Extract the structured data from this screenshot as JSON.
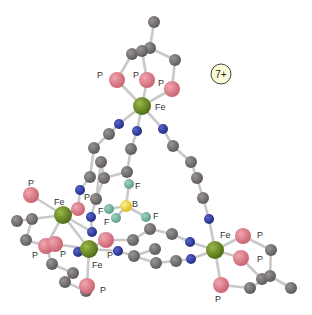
{
  "diagram": {
    "title": "",
    "charge_label": "7+",
    "charge_badge": {
      "x": 221,
      "y": 74,
      "r": 10,
      "fill": "#fbfbd6",
      "stroke": "#444"
    },
    "colors": {
      "Fe": "#5a7a1e",
      "P": "#d9707e",
      "N": "#2b3796",
      "C": "#6f6a6a",
      "B": "#e8d030",
      "F": "#6fae98",
      "bond": "#c9c9c9"
    },
    "atoms": [
      {
        "id": "c0",
        "el": "C",
        "x": 154,
        "y": 22,
        "r": 6
      },
      {
        "id": "c1",
        "el": "C",
        "x": 150,
        "y": 48,
        "r": 6
      },
      {
        "id": "c2",
        "el": "C",
        "x": 132,
        "y": 54,
        "r": 6
      },
      {
        "id": "c3",
        "el": "C",
        "x": 142,
        "y": 51,
        "r": 6
      },
      {
        "id": "c4",
        "el": "C",
        "x": 175,
        "y": 60,
        "r": 6
      },
      {
        "id": "p1",
        "el": "P",
        "x": 117,
        "y": 80,
        "r": 8
      },
      {
        "id": "p2",
        "el": "P",
        "x": 147,
        "y": 80,
        "r": 8
      },
      {
        "id": "p3",
        "el": "P",
        "x": 172,
        "y": 89,
        "r": 8
      },
      {
        "id": "fe1",
        "el": "Fe",
        "x": 142,
        "y": 106,
        "r": 9
      },
      {
        "id": "n1",
        "el": "N",
        "x": 119,
        "y": 124,
        "r": 5
      },
      {
        "id": "n2",
        "el": "N",
        "x": 137,
        "y": 131,
        "r": 5
      },
      {
        "id": "n3",
        "el": "N",
        "x": 163,
        "y": 129,
        "r": 5
      },
      {
        "id": "c5",
        "el": "C",
        "x": 109,
        "y": 134,
        "r": 6
      },
      {
        "id": "c6",
        "el": "C",
        "x": 131,
        "y": 149,
        "r": 6
      },
      {
        "id": "c7",
        "el": "C",
        "x": 173,
        "y": 146,
        "r": 6
      },
      {
        "id": "c8",
        "el": "C",
        "x": 94,
        "y": 148,
        "r": 6
      },
      {
        "id": "c9",
        "el": "C",
        "x": 101,
        "y": 162,
        "r": 6
      },
      {
        "id": "c10",
        "el": "C",
        "x": 127,
        "y": 172,
        "r": 6
      },
      {
        "id": "c11",
        "el": "C",
        "x": 191,
        "y": 162,
        "r": 6
      },
      {
        "id": "c12",
        "el": "C",
        "x": 90,
        "y": 177,
        "r": 6
      },
      {
        "id": "c13",
        "el": "C",
        "x": 104,
        "y": 178,
        "r": 6
      },
      {
        "id": "c14",
        "el": "C",
        "x": 197,
        "y": 178,
        "r": 6
      },
      {
        "id": "n4",
        "el": "N",
        "x": 80,
        "y": 190,
        "r": 5
      },
      {
        "id": "c15",
        "el": "C",
        "x": 96,
        "y": 199,
        "r": 6
      },
      {
        "id": "c16",
        "el": "C",
        "x": 203,
        "y": 198,
        "r": 6
      },
      {
        "id": "p4",
        "el": "P",
        "x": 78,
        "y": 209,
        "r": 7
      },
      {
        "id": "n5",
        "el": "N",
        "x": 91,
        "y": 217,
        "r": 5
      },
      {
        "id": "n6",
        "el": "N",
        "x": 209,
        "y": 219,
        "r": 5
      },
      {
        "id": "f1",
        "el": "F",
        "x": 129,
        "y": 184,
        "r": 5
      },
      {
        "id": "b1",
        "el": "B",
        "x": 126,
        "y": 206,
        "r": 6
      },
      {
        "id": "f2",
        "el": "F",
        "x": 109,
        "y": 209,
        "r": 5
      },
      {
        "id": "f3",
        "el": "F",
        "x": 116,
        "y": 218,
        "r": 5
      },
      {
        "id": "f4",
        "el": "F",
        "x": 146,
        "y": 217,
        "r": 5
      },
      {
        "id": "p5",
        "el": "P",
        "x": 31,
        "y": 195,
        "r": 8
      },
      {
        "id": "fe2",
        "el": "Fe",
        "x": 63,
        "y": 215,
        "r": 9
      },
      {
        "id": "c17",
        "el": "C",
        "x": 32,
        "y": 219,
        "r": 6
      },
      {
        "id": "c18",
        "el": "C",
        "x": 17,
        "y": 221,
        "r": 6
      },
      {
        "id": "c19",
        "el": "C",
        "x": 26,
        "y": 240,
        "r": 6
      },
      {
        "id": "n7",
        "el": "N",
        "x": 92,
        "y": 232,
        "r": 5
      },
      {
        "id": "c20",
        "el": "C",
        "x": 150,
        "y": 229,
        "r": 6
      },
      {
        "id": "c21",
        "el": "C",
        "x": 133,
        "y": 240,
        "r": 6
      },
      {
        "id": "c22",
        "el": "C",
        "x": 172,
        "y": 234,
        "r": 6
      },
      {
        "id": "n8",
        "el": "N",
        "x": 190,
        "y": 242,
        "r": 5
      },
      {
        "id": "p6",
        "el": "P",
        "x": 46,
        "y": 246,
        "r": 8
      },
      {
        "id": "p7",
        "el": "P",
        "x": 55,
        "y": 244,
        "r": 8
      },
      {
        "id": "p8",
        "el": "P",
        "x": 106,
        "y": 240,
        "r": 8
      },
      {
        "id": "fe3",
        "el": "Fe",
        "x": 89,
        "y": 249,
        "r": 9
      },
      {
        "id": "n9",
        "el": "N",
        "x": 78,
        "y": 252,
        "r": 5
      },
      {
        "id": "n10",
        "el": "N",
        "x": 118,
        "y": 251,
        "r": 5
      },
      {
        "id": "c23",
        "el": "C",
        "x": 134,
        "y": 256,
        "r": 6
      },
      {
        "id": "c24",
        "el": "C",
        "x": 155,
        "y": 249,
        "r": 6
      },
      {
        "id": "c25",
        "el": "C",
        "x": 156,
        "y": 263,
        "r": 6
      },
      {
        "id": "c26",
        "el": "C",
        "x": 176,
        "y": 261,
        "r": 6
      },
      {
        "id": "n11",
        "el": "N",
        "x": 191,
        "y": 259,
        "r": 5
      },
      {
        "id": "fe4",
        "el": "Fe",
        "x": 215,
        "y": 250,
        "r": 9
      },
      {
        "id": "p9",
        "el": "P",
        "x": 243,
        "y": 236,
        "r": 8
      },
      {
        "id": "p10",
        "el": "P",
        "x": 241,
        "y": 258,
        "r": 8
      },
      {
        "id": "c27",
        "el": "C",
        "x": 271,
        "y": 250,
        "r": 6
      },
      {
        "id": "c28",
        "el": "C",
        "x": 262,
        "y": 279,
        "r": 6
      },
      {
        "id": "c29",
        "el": "C",
        "x": 270,
        "y": 276,
        "r": 6
      },
      {
        "id": "c30",
        "el": "C",
        "x": 291,
        "y": 288,
        "r": 6
      },
      {
        "id": "p11",
        "el": "P",
        "x": 221,
        "y": 285,
        "r": 8
      },
      {
        "id": "c31",
        "el": "C",
        "x": 250,
        "y": 288,
        "r": 6
      },
      {
        "id": "c32",
        "el": "C",
        "x": 52,
        "y": 264,
        "r": 6
      },
      {
        "id": "c33",
        "el": "C",
        "x": 73,
        "y": 273,
        "r": 6
      },
      {
        "id": "c34",
        "el": "C",
        "x": 65,
        "y": 282,
        "r": 6
      },
      {
        "id": "p12",
        "el": "P",
        "x": 87,
        "y": 286,
        "r": 8
      },
      {
        "id": "c35",
        "el": "C",
        "x": 86,
        "y": 291,
        "r": 6
      }
    ],
    "bonds": [
      [
        "c0",
        "c1"
      ],
      [
        "c1",
        "c2"
      ],
      [
        "c1",
        "c3"
      ],
      [
        "c1",
        "c4"
      ],
      [
        "c2",
        "p1"
      ],
      [
        "c3",
        "p2"
      ],
      [
        "c4",
        "p3"
      ],
      [
        "p1",
        "fe1"
      ],
      [
        "p2",
        "fe1"
      ],
      [
        "p3",
        "fe1"
      ],
      [
        "fe1",
        "n1"
      ],
      [
        "fe1",
        "n2"
      ],
      [
        "fe1",
        "n3"
      ],
      [
        "n1",
        "c5"
      ],
      [
        "c5",
        "c8"
      ],
      [
        "c8",
        "c12"
      ],
      [
        "c12",
        "n4"
      ],
      [
        "n4",
        "p4"
      ],
      [
        "n2",
        "c6"
      ],
      [
        "c6",
        "c10"
      ],
      [
        "c10",
        "c13"
      ],
      [
        "c13",
        "c15"
      ],
      [
        "c15",
        "n5"
      ],
      [
        "n3",
        "c7"
      ],
      [
        "c7",
        "c11"
      ],
      [
        "c11",
        "c14"
      ],
      [
        "c14",
        "c16"
      ],
      [
        "c16",
        "n6"
      ],
      [
        "n6",
        "fe4"
      ],
      [
        "c9",
        "c13"
      ],
      [
        "c9",
        "c15"
      ],
      [
        "f1",
        "b1"
      ],
      [
        "b1",
        "f2"
      ],
      [
        "b1",
        "f3"
      ],
      [
        "b1",
        "f4"
      ],
      [
        "p5",
        "fe2"
      ],
      [
        "fe2",
        "p4"
      ],
      [
        "fe2",
        "c17"
      ],
      [
        "c17",
        "c18"
      ],
      [
        "c17",
        "c19"
      ],
      [
        "c19",
        "p6"
      ],
      [
        "fe2",
        "p6"
      ],
      [
        "fe2",
        "n7"
      ],
      [
        "fe2",
        "fe3"
      ],
      [
        "n5",
        "n7"
      ],
      [
        "fe3",
        "p7"
      ],
      [
        "fe3",
        "p8"
      ],
      [
        "fe3",
        "n9"
      ],
      [
        "fe3",
        "n10"
      ],
      [
        "fe3",
        "p12"
      ],
      [
        "p8",
        "c21"
      ],
      [
        "c21",
        "c20"
      ],
      [
        "c20",
        "c22"
      ],
      [
        "c22",
        "n8"
      ],
      [
        "n8",
        "fe4"
      ],
      [
        "n10",
        "c23"
      ],
      [
        "c23",
        "c25"
      ],
      [
        "c25",
        "c26"
      ],
      [
        "c26",
        "n11"
      ],
      [
        "n11",
        "fe4"
      ],
      [
        "c23",
        "c24"
      ],
      [
        "fe4",
        "p9"
      ],
      [
        "fe4",
        "p10"
      ],
      [
        "fe4",
        "p11"
      ],
      [
        "p9",
        "c27"
      ],
      [
        "c27",
        "c29"
      ],
      [
        "p10",
        "c28"
      ],
      [
        "c28",
        "c29"
      ],
      [
        "c29",
        "c30"
      ],
      [
        "p11",
        "c31"
      ],
      [
        "c31",
        "c29"
      ],
      [
        "p6",
        "c32"
      ],
      [
        "c32",
        "c33"
      ],
      [
        "c33",
        "c34"
      ],
      [
        "c34",
        "c35"
      ],
      [
        "c35",
        "p12"
      ]
    ],
    "labels": [
      {
        "text": "P",
        "x": 97,
        "y": 78
      },
      {
        "text": "P",
        "x": 133,
        "y": 78
      },
      {
        "text": "P",
        "x": 158,
        "y": 86
      },
      {
        "text": "Fe",
        "x": 155,
        "y": 110
      },
      {
        "text": "P",
        "x": 28,
        "y": 186
      },
      {
        "text": "Fe",
        "x": 54,
        "y": 205
      },
      {
        "text": "P",
        "x": 84,
        "y": 200
      },
      {
        "text": "F",
        "x": 135,
        "y": 189
      },
      {
        "text": "B",
        "x": 132,
        "y": 207
      },
      {
        "text": "F",
        "x": 98,
        "y": 214
      },
      {
        "text": "F",
        "x": 104,
        "y": 225
      },
      {
        "text": "F",
        "x": 153,
        "y": 219
      },
      {
        "text": "P",
        "x": 32,
        "y": 258
      },
      {
        "text": "P",
        "x": 60,
        "y": 257
      },
      {
        "text": "P",
        "x": 107,
        "y": 258
      },
      {
        "text": "Fe",
        "x": 92,
        "y": 268
      },
      {
        "text": "P",
        "x": 100,
        "y": 293
      },
      {
        "text": "Fe",
        "x": 220,
        "y": 238
      },
      {
        "text": "P",
        "x": 257,
        "y": 238
      },
      {
        "text": "P",
        "x": 257,
        "y": 262
      },
      {
        "text": "P",
        "x": 215,
        "y": 302
      }
    ]
  }
}
